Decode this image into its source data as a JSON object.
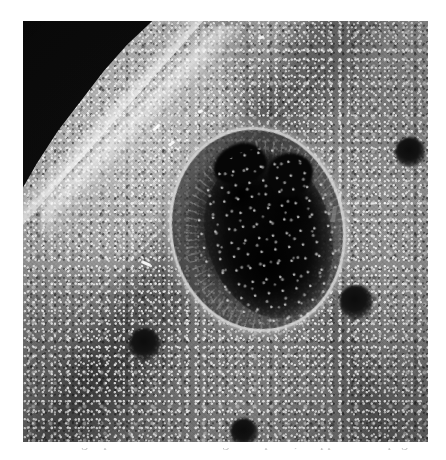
{
  "page": {
    "background_color": "#ffffff",
    "width": 446,
    "height": 460
  },
  "figure": {
    "kind": "grayscale-micrograph",
    "plate": {
      "left": 23,
      "top": 21,
      "width": 405,
      "height": 421,
      "tone_light": "#bcbcbc",
      "tone_mid": "#939393",
      "tone_dark": "#6f6f6f",
      "corner_color": "#0b0b0b"
    },
    "lesion": {
      "label": "central-lesion",
      "center_x": 231,
      "center_y": 206,
      "width": 190,
      "height": 220,
      "rotation_deg": -10,
      "rim_color": "#e4e4e4",
      "core_color": "#070707",
      "description": "oval lesion with bright raised rim, radiating fringe and near-black necrotic core"
    },
    "dark_corner": {
      "label": "dark-background-wedge",
      "position": "top-left",
      "color": "#0b0b0b"
    },
    "ridge": {
      "label": "bright-ridge",
      "description": "bright raised fold running diagonally along the dark wedge"
    },
    "spots": [
      {
        "name": "spot-upper-right",
        "x": 410,
        "y": 152,
        "size": 30
      },
      {
        "name": "spot-mid-right",
        "x": 356,
        "y": 302,
        "size": 34
      },
      {
        "name": "spot-lower-left",
        "x": 145,
        "y": 344,
        "size": 32
      },
      {
        "name": "spot-bottom",
        "x": 244,
        "y": 432,
        "size": 28
      }
    ],
    "glints": [
      {
        "name": "glint-a",
        "x": 168,
        "y": 142,
        "w": 7,
        "h": 3,
        "rot": -38
      },
      {
        "name": "glint-b",
        "x": 152,
        "y": 126,
        "w": 9,
        "h": 3,
        "rot": -42
      },
      {
        "name": "glint-c",
        "x": 332,
        "y": 206,
        "w": 4,
        "h": 16,
        "rot": 8
      },
      {
        "name": "glint-d",
        "x": 338,
        "y": 196,
        "w": 3,
        "h": 11,
        "rot": -6
      },
      {
        "name": "glint-e",
        "x": 141,
        "y": 262,
        "w": 10,
        "h": 3,
        "rot": 24
      },
      {
        "name": "glint-f",
        "x": 258,
        "y": 36,
        "w": 6,
        "h": 3,
        "rot": -18
      },
      {
        "name": "glint-g",
        "x": 198,
        "y": 110,
        "w": 5,
        "h": 3,
        "rot": -30
      }
    ]
  },
  "caption": {
    "text": "ascending tops of letters of the figure caption, cropped at the page edge"
  }
}
